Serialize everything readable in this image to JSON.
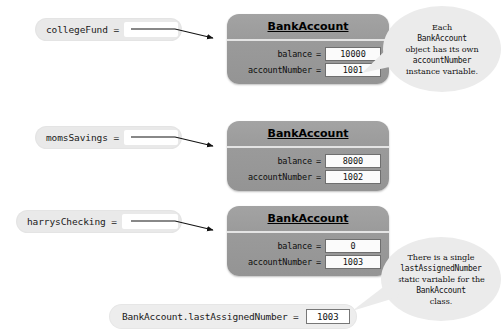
{
  "diagram": {
    "object_class_name": "BankAccount",
    "field_labels": {
      "balance": "balance",
      "account_number": "accountNumber"
    },
    "equals": "=",
    "objects": [
      {
        "variable_label": "collegeFund =",
        "class_name": "BankAccount",
        "balance_label": "balance",
        "balance_value": "10000",
        "account_number_label": "accountNumber",
        "account_number_value": "1001"
      },
      {
        "variable_label": "momsSavings =",
        "class_name": "BankAccount",
        "balance_label": "balance",
        "balance_value": "8000",
        "account_number_label": "accountNumber",
        "account_number_value": "1002"
      },
      {
        "variable_label": "harrysChecking =",
        "class_name": "BankAccount",
        "balance_label": "balance",
        "balance_value": "0",
        "account_number_label": "accountNumber",
        "account_number_value": "1003"
      }
    ],
    "static_variable": {
      "label": "BankAccount.lastAssignedNumber =",
      "value": "1003"
    },
    "callouts": [
      {
        "id": "instance-variable-note",
        "lines": [
          {
            "text": "Each",
            "style": "serif"
          },
          {
            "text": "BankAccount",
            "style": "mono"
          },
          {
            "text": "object has its own",
            "style": "serif"
          },
          {
            "text": "accountNumber",
            "style": "mono"
          },
          {
            "text": "instance variable.",
            "style": "serif"
          }
        ]
      },
      {
        "id": "static-variable-note",
        "lines": [
          {
            "text": "There is a single",
            "style": "serif"
          },
          {
            "text": "lastAssignedNumber",
            "style": "mono"
          },
          {
            "text": "static variable for the",
            "style": "serif"
          },
          {
            "text": "BankAccount",
            "style": "mono"
          },
          {
            "text": "class.",
            "style": "serif"
          }
        ]
      }
    ],
    "colors": {
      "object_box_fill": "#9a9a9a",
      "pill_fill": "#e9e9e9",
      "callout_fill": "#ebebeb",
      "value_field_fill": "#fbfbfb",
      "arrow_stroke": "#1a1a1a",
      "background": "#ffffff"
    }
  }
}
